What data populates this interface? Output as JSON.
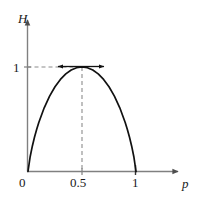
{
  "figure": {
    "kind": "binary-entropy-plot",
    "axes": {
      "y": {
        "name": "H",
        "ticks": [
          {
            "label": "1",
            "value": 1
          }
        ],
        "range": [
          0,
          1.18
        ],
        "arrow": true
      },
      "x": {
        "name": "p",
        "ticks": [
          {
            "label": "0",
            "value": 0
          },
          {
            "label": "0.5",
            "value": 0.5
          },
          {
            "label": "1",
            "value": 1
          }
        ],
        "range": [
          0,
          1.42
        ],
        "arrow": true
      }
    },
    "colors": {
      "curve": "#111111",
      "axis": "#808080",
      "guide": "#8c8c8c",
      "arrow": "#111111",
      "text": "#1a1a1a",
      "background": "#ffffff"
    },
    "annotations": {
      "guide_horizontal": {
        "from_x": 0,
        "to_x": 0.5,
        "y": 1,
        "dashed": true
      },
      "guide_vertical": {
        "x": 0.5,
        "from_y": 0,
        "to_y": 1,
        "dashed": true
      },
      "arrow_left": {
        "direction": "left",
        "tip_x": 0.27,
        "tail_x": 0.5,
        "y": 1
      },
      "arrow_right": {
        "direction": "right",
        "tip_x": 0.74,
        "tail_x": 0.5,
        "y": 1
      }
    }
  },
  "chart_data": {
    "type": "line",
    "title": "",
    "xlabel": "p",
    "ylabel": "H",
    "xlim": [
      0,
      1.42
    ],
    "ylim": [
      0,
      1.18
    ],
    "grid": false,
    "legend_position": "none",
    "xticks": [
      0,
      0.5,
      1
    ],
    "xticklabels": [
      "0",
      "0.5",
      "1"
    ],
    "yticks": [
      1
    ],
    "yticklabels": [
      "1"
    ],
    "series": [
      {
        "name": "H(p) = -p log2 p - (1-p) log2 (1-p)",
        "x": [
          0,
          0.02,
          0.04,
          0.06,
          0.08,
          0.1,
          0.15,
          0.2,
          0.25,
          0.3,
          0.35,
          0.4,
          0.45,
          0.5,
          0.55,
          0.6,
          0.65,
          0.7,
          0.75,
          0.8,
          0.85,
          0.9,
          0.92,
          0.94,
          0.96,
          0.98,
          1
        ],
        "y": [
          0,
          0.1414,
          0.2423,
          0.3274,
          0.4022,
          0.469,
          0.6098,
          0.7219,
          0.8113,
          0.8813,
          0.9341,
          0.971,
          0.9928,
          1,
          0.9928,
          0.971,
          0.9341,
          0.8813,
          0.8113,
          0.7219,
          0.6098,
          0.469,
          0.4022,
          0.3274,
          0.2423,
          0.1414,
          0
        ]
      }
    ],
    "annotations": [
      {
        "text": "peak",
        "x": 0.5,
        "y": 1
      }
    ]
  }
}
